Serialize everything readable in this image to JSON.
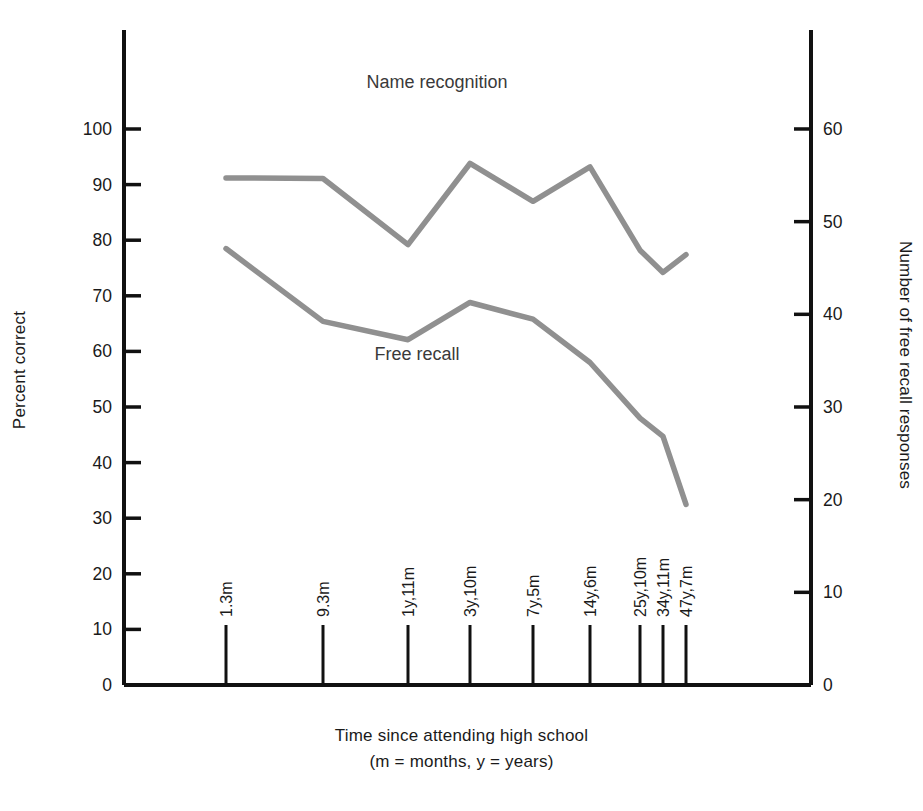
{
  "chart_data": {
    "type": "line",
    "title": "",
    "xlabel": "Time since attending high school",
    "xlabel_line2": "(m = months, y = years)",
    "ylabel": "Percent correct",
    "ylabel_right": "Number of free recall responses",
    "grid": false,
    "legend_position": "inline-annotation",
    "categories": [
      "1.3m",
      "9.3m",
      "1y,11m",
      "3y,10m",
      "7y,5m",
      "14y,6m",
      "25y,10m",
      "34y,11m",
      "47y,7m"
    ],
    "ylim": [
      0,
      105
    ],
    "yticks": [
      0,
      10,
      20,
      30,
      40,
      50,
      60,
      70,
      80,
      90,
      100
    ],
    "ylim_right": [
      0,
      63
    ],
    "yticks_right": [
      0,
      10,
      20,
      30,
      40,
      50,
      60
    ],
    "series": [
      {
        "name": "Name recognition",
        "axis": "left",
        "color": "#909090",
        "values": [
          91.2,
          91.1,
          79.2,
          93.8,
          87.0,
          93.2,
          78.2,
          74.2,
          77.4
        ]
      },
      {
        "name": "Free recall",
        "axis": "left",
        "color": "#909090",
        "values": [
          78.5,
          65.4,
          62.1,
          68.8,
          65.8,
          58.0,
          48.0,
          44.7,
          32.5
        ]
      }
    ],
    "annotations": [
      {
        "text": "Name recognition",
        "x_px": 437,
        "y_px": 88
      },
      {
        "text": "Free recall",
        "x_px": 417,
        "y_px": 360
      }
    ]
  },
  "axes": {
    "left_tick_labels": [
      "100",
      "90",
      "80",
      "70",
      "60",
      "50",
      "40",
      "30",
      "20",
      "10",
      "0"
    ],
    "right_tick_labels": [
      "60",
      "50",
      "40",
      "30",
      "20",
      "10",
      "0"
    ]
  }
}
